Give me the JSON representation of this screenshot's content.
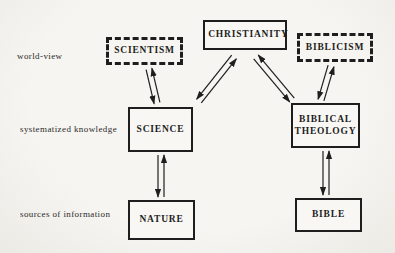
{
  "diagram": {
    "row_labels": [
      {
        "id": "world-view",
        "label": "world-view"
      },
      {
        "id": "systematized-knowledge",
        "label": "systematized knowledge"
      },
      {
        "id": "sources-of-information",
        "label": "sources of information"
      }
    ],
    "nodes": [
      {
        "id": "christianity",
        "label": "CHRISTIANITY",
        "border": "solid"
      },
      {
        "id": "scientism",
        "label": "SCIENTISM",
        "border": "dashed"
      },
      {
        "id": "biblicism",
        "label": "BIBLICISM",
        "border": "dashed"
      },
      {
        "id": "science",
        "label": "SCIENCE",
        "border": "solid"
      },
      {
        "id": "biblical-theology",
        "label": "BIBLICAL THEOLOGY",
        "border": "solid"
      },
      {
        "id": "nature",
        "label": "NATURE",
        "border": "solid"
      },
      {
        "id": "bible",
        "label": "BIBLE",
        "border": "solid"
      }
    ],
    "edges": [
      {
        "from": "scientism",
        "to": "science",
        "bidirectional": true
      },
      {
        "from": "christianity",
        "to": "science",
        "bidirectional": true
      },
      {
        "from": "christianity",
        "to": "biblical-theology",
        "bidirectional": true
      },
      {
        "from": "biblicism",
        "to": "biblical-theology",
        "bidirectional": true
      },
      {
        "from": "science",
        "to": "nature",
        "bidirectional": true
      },
      {
        "from": "biblical-theology",
        "to": "bible",
        "bidirectional": true
      }
    ],
    "colors": {
      "ink": "#1e1e1e",
      "paper": "#f4f2ee"
    }
  }
}
